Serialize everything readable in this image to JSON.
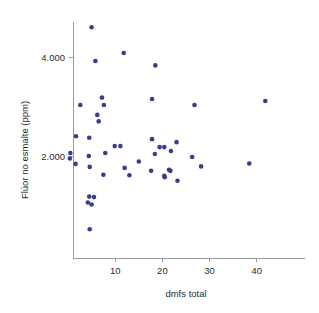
{
  "chart_data": {
    "type": "scatter",
    "title": "",
    "xlabel": "dmfs total",
    "ylabel": "Flúor no esmalte (ppm)",
    "xlim": [
      0,
      50
    ],
    "ylim": [
      300,
      5000
    ],
    "xticks": [
      10,
      20,
      30,
      40
    ],
    "xticklabels": [
      "10",
      "20",
      "30",
      "40"
    ],
    "yticks": [
      2000,
      4000
    ],
    "yticklabels": [
      "2.000",
      "4.000"
    ],
    "grid": false,
    "legend": null,
    "marker_color": "#3b3b8f",
    "marker_size": 2.3,
    "axis_color": "#9a9a9a",
    "points": [
      {
        "x": 5.0,
        "y": 4600
      },
      {
        "x": 11.8,
        "y": 4080
      },
      {
        "x": 5.8,
        "y": 3920
      },
      {
        "x": 18.5,
        "y": 3830
      },
      {
        "x": 7.2,
        "y": 3180
      },
      {
        "x": 17.8,
        "y": 3150
      },
      {
        "x": 41.8,
        "y": 3110
      },
      {
        "x": 2.6,
        "y": 3030
      },
      {
        "x": 7.6,
        "y": 3030
      },
      {
        "x": 26.8,
        "y": 3030
      },
      {
        "x": 6.2,
        "y": 2830
      },
      {
        "x": 6.5,
        "y": 2700
      },
      {
        "x": 1.7,
        "y": 2400
      },
      {
        "x": 4.5,
        "y": 2370
      },
      {
        "x": 17.8,
        "y": 2340
      },
      {
        "x": 23.0,
        "y": 2280
      },
      {
        "x": 9.9,
        "y": 2200
      },
      {
        "x": 11.1,
        "y": 2200
      },
      {
        "x": 19.4,
        "y": 2180
      },
      {
        "x": 20.4,
        "y": 2180
      },
      {
        "x": 21.8,
        "y": 2100
      },
      {
        "x": 0.5,
        "y": 2060
      },
      {
        "x": 7.9,
        "y": 2060
      },
      {
        "x": 18.4,
        "y": 2040
      },
      {
        "x": 4.4,
        "y": 2000
      },
      {
        "x": 0.4,
        "y": 1950
      },
      {
        "x": 26.3,
        "y": 1980
      },
      {
        "x": 15.0,
        "y": 1890
      },
      {
        "x": 1.6,
        "y": 1840
      },
      {
        "x": 38.4,
        "y": 1850
      },
      {
        "x": 4.6,
        "y": 1780
      },
      {
        "x": 12.0,
        "y": 1760
      },
      {
        "x": 28.2,
        "y": 1790
      },
      {
        "x": 17.6,
        "y": 1700
      },
      {
        "x": 21.4,
        "y": 1720
      },
      {
        "x": 21.7,
        "y": 1700
      },
      {
        "x": 7.5,
        "y": 1620
      },
      {
        "x": 13.0,
        "y": 1610
      },
      {
        "x": 20.4,
        "y": 1600
      },
      {
        "x": 20.5,
        "y": 1570
      },
      {
        "x": 23.2,
        "y": 1500
      },
      {
        "x": 4.5,
        "y": 1180
      },
      {
        "x": 5.5,
        "y": 1170
      },
      {
        "x": 4.2,
        "y": 1060
      },
      {
        "x": 5.0,
        "y": 1020
      },
      {
        "x": 4.6,
        "y": 520
      }
    ]
  }
}
